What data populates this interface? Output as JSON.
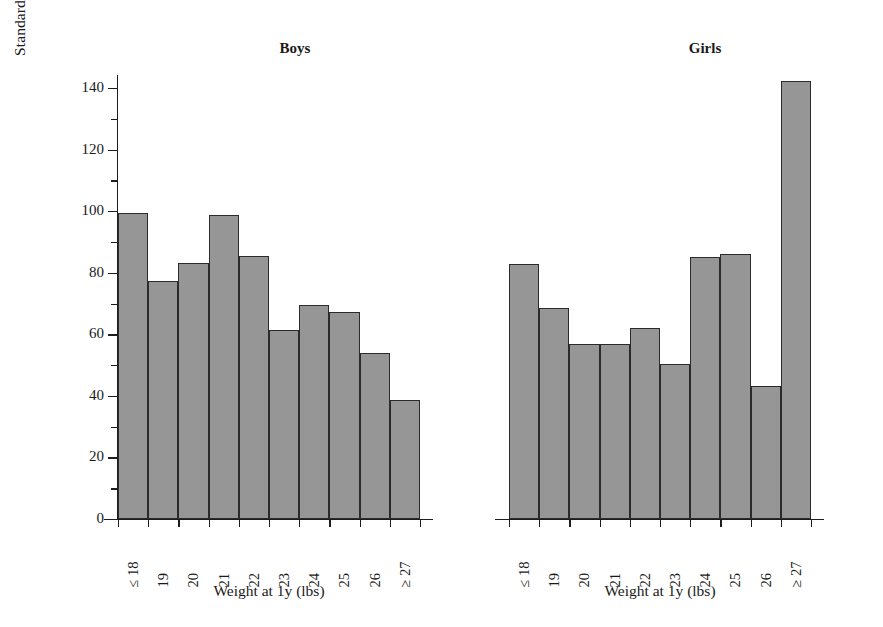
{
  "chart_data": {
    "type": "bar",
    "title": "",
    "ylabel": "Standardized Mortality Ratio for CHD before Age 65y",
    "xlabel": "Weight at 1y (lbs)",
    "ylim": [
      0,
      148
    ],
    "yticks": [
      0,
      20,
      40,
      60,
      80,
      100,
      120,
      140
    ],
    "ytick_labels": [
      "0",
      "20",
      "40",
      "60",
      "80",
      "100",
      "120",
      "140"
    ],
    "yminor_ticks": [
      10,
      30,
      50,
      70,
      90,
      110,
      130
    ],
    "grid": false,
    "legend": "none",
    "categories": [
      "≤ 18",
      "19",
      "20",
      "21",
      "22",
      "23",
      "24",
      "25",
      "26",
      "≥ 27"
    ],
    "panels": [
      {
        "name": "boys",
        "title": "Boys",
        "xlabel": "Weight at 1y (lbs)",
        "values": [
          99.3,
          77.4,
          83.2,
          98.7,
          85.5,
          61.3,
          69.4,
          67.2,
          53.8,
          38.7
        ]
      },
      {
        "name": "girls",
        "title": "Girls",
        "xlabel": "Weight at 1y (lbs)",
        "values": [
          82.8,
          68.7,
          56.7,
          56.7,
          62.0,
          50.2,
          85.2,
          86.0,
          43.3,
          142.2
        ]
      }
    ],
    "series": [
      {
        "name": "Boys",
        "values": [
          99.3,
          77.4,
          83.2,
          98.7,
          85.5,
          61.3,
          69.4,
          67.2,
          53.8,
          38.7
        ]
      },
      {
        "name": "Girls",
        "values": [
          82.8,
          68.7,
          56.7,
          56.7,
          62.0,
          50.2,
          85.2,
          86.0,
          43.3,
          142.2
        ]
      }
    ],
    "colors": {
      "bar_fill": "#969696",
      "bar_edge": "#2b2b2b",
      "axis": "#1d1d1d",
      "text": "#1a1a1a",
      "background": "#ffffff"
    }
  }
}
